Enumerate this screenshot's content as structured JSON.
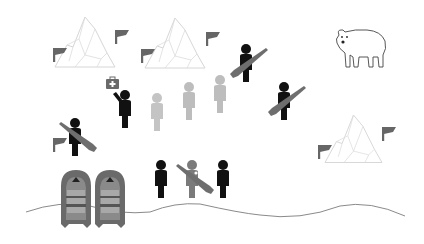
{
  "scene": {
    "description": "Arctic expedition scene: icebergs with flags, a polar bear, armed guards, a group of people, a medic, and two inflatable boats at the shoreline",
    "colors": {
      "background": "#ffffff",
      "person_dark": "#111111",
      "person_light": "#bdbdbd",
      "person_mid": "#7a7a7a",
      "rifle": "#6e6e6e",
      "flag": "#666666",
      "iceberg_stroke": "#d6d6d6",
      "boat": "#6a6a6a",
      "boat_seat": "#a8a8a8",
      "shoreline": "#8a8a8a",
      "medkit": "#6a6a6a"
    },
    "icebergs": [
      {
        "name": "iceberg-top-left",
        "x": 55,
        "y": 17
      },
      {
        "name": "iceberg-top-center",
        "x": 145,
        "y": 18
      },
      {
        "name": "iceberg-right",
        "x": 325,
        "y": 115
      }
    ],
    "flags": [
      {
        "x": 53,
        "y": 48
      },
      {
        "x": 115,
        "y": 30
      },
      {
        "x": 141,
        "y": 49
      },
      {
        "x": 206,
        "y": 32
      },
      {
        "x": 318,
        "y": 145
      },
      {
        "x": 382,
        "y": 127
      },
      {
        "x": 53,
        "y": 138
      }
    ],
    "polar_bear": {
      "x": 333,
      "y": 27
    },
    "guards_with_rifles": [
      {
        "x": 238,
        "y": 44
      },
      {
        "x": 276,
        "y": 82
      },
      {
        "x": 63,
        "y": 118
      },
      {
        "x": 183,
        "y": 160
      }
    ],
    "people_dark": [
      {
        "x": 117,
        "y": 90
      },
      {
        "x": 153,
        "y": 160
      },
      {
        "x": 216,
        "y": 160
      }
    ],
    "people_light": [
      {
        "x": 149,
        "y": 93
      },
      {
        "x": 181,
        "y": 82
      },
      {
        "x": 212,
        "y": 75
      }
    ],
    "medkit": {
      "x": 106,
      "y": 77
    },
    "boats": [
      {
        "x": 61,
        "y": 170
      },
      {
        "x": 95,
        "y": 170
      }
    ]
  }
}
